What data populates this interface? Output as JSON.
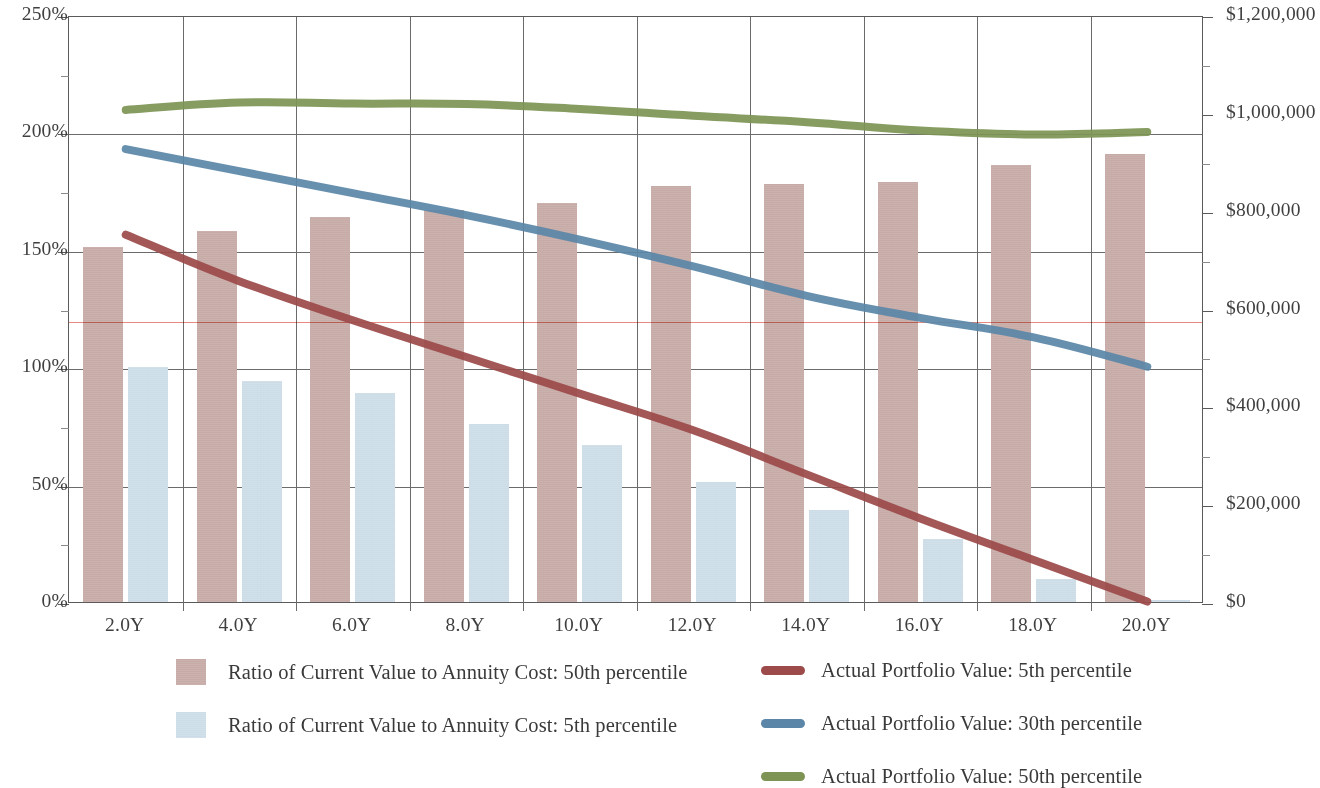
{
  "chart_data": {
    "type": "bar",
    "title": "",
    "subtitle": "",
    "xlabel": "",
    "ylabel": "",
    "grid": true,
    "legend_position": "bottom",
    "categories": [
      "2.0Y",
      "4.0Y",
      "6.0Y",
      "8.0Y",
      "10.0Y",
      "12.0Y",
      "14.0Y",
      "16.0Y",
      "18.0Y",
      "20.0Y"
    ],
    "x_tick_labels": [
      "2.0Y",
      "4.0Y",
      "6.0Y",
      "8.0Y",
      "10.0Y",
      "12.0Y",
      "14.0Y",
      "16.0Y",
      "18.0Y",
      "20.0Y"
    ],
    "left_axis": {
      "label": "",
      "ylim": [
        0,
        250
      ],
      "unit": "%",
      "tick_labels": [
        "0%",
        "50%",
        "100%",
        "150%",
        "200%",
        "250%"
      ],
      "tick_values": [
        0,
        50,
        100,
        150,
        200,
        250
      ],
      "minor_tick_values": [
        25,
        75,
        125,
        175,
        225
      ]
    },
    "right_axis": {
      "label": "",
      "ylim": [
        0,
        1200000
      ],
      "unit": "$",
      "tick_labels": [
        "$0",
        "$200,000",
        "$400,000",
        "$600,000",
        "$800,000",
        "$1,000,000",
        "$1,200,000"
      ],
      "tick_values": [
        0,
        200000,
        400000,
        600000,
        800000,
        1000000,
        1200000
      ],
      "minor_tick_values": [
        100000,
        300000,
        500000,
        700000,
        900000,
        1100000
      ]
    },
    "reference_line": {
      "name": "annuity-cost-reference",
      "axis": "left",
      "value": 120,
      "color": "#e98a80"
    },
    "bar_series": [
      {
        "name": "Ratio of Current Value to Annuity Cost: 50th percentile",
        "axis": "left",
        "unit": "%",
        "color": "#c7aba7",
        "values": [
          151,
          158,
          164,
          167,
          170,
          177,
          178,
          179,
          186,
          191
        ]
      },
      {
        "name": "Ratio of Current Value to Annuity Cost: 5th percentile",
        "axis": "left",
        "unit": "%",
        "color": "#cddde7",
        "values": [
          100,
          94,
          89,
          76,
          67,
          51,
          39,
          27,
          10,
          1
        ]
      }
    ],
    "line_series": [
      {
        "name": "Actual Portfolio Value: 5th percentile",
        "axis": "right",
        "unit": "$",
        "color": "#9c4a4a",
        "values": [
          755000,
          660000,
          580000,
          505000,
          430000,
          355000,
          265000,
          175000,
          90000,
          5000
        ]
      },
      {
        "name": "Actual Portfolio Value: 30th percentile",
        "axis": "right",
        "unit": "$",
        "color": "#5b86a8",
        "values": [
          930000,
          885000,
          840000,
          795000,
          745000,
          690000,
          630000,
          585000,
          545000,
          485000
        ]
      },
      {
        "name": "Actual Portfolio Value: 50th percentile",
        "axis": "right",
        "unit": "$",
        "color": "#7d9455",
        "values": [
          1010000,
          1025000,
          1023000,
          1022000,
          1012000,
          998000,
          985000,
          968000,
          960000,
          965000
        ]
      }
    ]
  },
  "legend": {
    "entries": [
      {
        "label": "Ratio of Current Value to Annuity Cost: 50th percentile",
        "marker": "box",
        "color": "#c7aba7"
      },
      {
        "label": "Ratio of Current Value to Annuity Cost: 5th percentile",
        "marker": "box",
        "color": "#cddde7"
      },
      {
        "label": "Actual Portfolio Value: 5th percentile",
        "marker": "line",
        "color": "#9c4a4a"
      },
      {
        "label": "Actual Portfolio Value: 30th percentile",
        "marker": "line",
        "color": "#5b86a8"
      },
      {
        "label": "Actual Portfolio Value: 50th percentile",
        "marker": "line",
        "color": "#7d9455"
      }
    ]
  }
}
